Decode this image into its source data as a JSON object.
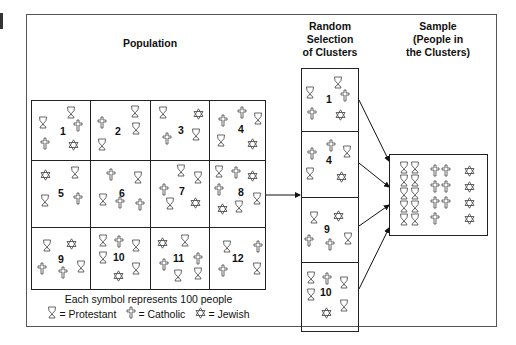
{
  "titles": {
    "population": "Population",
    "selection": [
      "Random",
      "Selection",
      "of Clusters"
    ],
    "sample": [
      "Sample",
      "(People in",
      "the Clusters)"
    ]
  },
  "legend": {
    "caption": "Each symbol represents 100 people",
    "protestant": "= Protestant",
    "catholic": "= Catholic",
    "jewish": "= Jewish"
  },
  "symbol_types": {
    "P": "protestant-goblet-icon",
    "C": "catholic-cross-icon",
    "J": "jewish-star-icon"
  },
  "clusters": [
    {
      "id": "1",
      "symbols": "P P C C J"
    },
    {
      "id": "2",
      "symbols": "P C P P"
    },
    {
      "id": "3",
      "symbols": "P J C P"
    },
    {
      "id": "4",
      "symbols": "C C P P J"
    },
    {
      "id": "5",
      "symbols": "J P P C"
    },
    {
      "id": "6",
      "symbols": "C P P C C"
    },
    {
      "id": "7",
      "symbols": "P P C P J"
    },
    {
      "id": "8",
      "symbols": "P C J C J P P"
    },
    {
      "id": "9",
      "symbols": "P J C C P"
    },
    {
      "id": "10",
      "symbols": "P C P P P J"
    },
    {
      "id": "11",
      "symbols": "J P C C P P"
    },
    {
      "id": "12",
      "symbols": "P C C P"
    }
  ],
  "selected_clusters": [
    "1",
    "4",
    "9",
    "10"
  ],
  "sample_counts": {
    "protestant": 10,
    "catholic": 7,
    "jewish": 4
  }
}
